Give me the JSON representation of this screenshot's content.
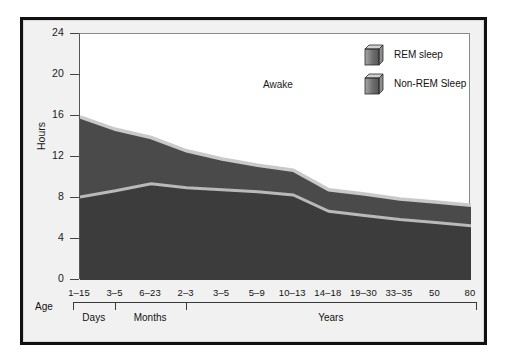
{
  "figure": {
    "axis_title_y": "Hours",
    "axis_title_x": "Age",
    "annotation_awake": "Awake"
  },
  "legend": {
    "items": [
      {
        "label": "REM sleep",
        "icon": "cube-icon",
        "color": "#6f6f6f"
      },
      {
        "label": "Non-REM Sleep",
        "icon": "cube-icon",
        "color": "#6f6f6f"
      }
    ]
  },
  "groups": [
    {
      "label": "Days",
      "start_index": 0,
      "end_index": 1
    },
    {
      "label": "Months",
      "start_index": 1,
      "end_index": 3
    },
    {
      "label": "Years",
      "start_index": 3,
      "end_index": 11
    }
  ],
  "colors": {
    "non_rem_fill": "#3c3c3c",
    "rem_fill": "#4a4a4a",
    "divider": "#b9b9b9",
    "total_edge": "#c9c9c9",
    "awake_fill": "#ffffff",
    "frame": "#111111",
    "page_bg": "#f1f1f1"
  },
  "chart_data": {
    "type": "area",
    "title": "",
    "subtitle": "",
    "xlabel": "Age",
    "ylabel": "Hours",
    "ylim": [
      0,
      24
    ],
    "yticks": [
      0,
      4,
      8,
      12,
      16,
      20,
      24
    ],
    "grid": false,
    "legend_position": "top-right",
    "stacked": true,
    "categories": [
      "1–15",
      "3–5",
      "6–23",
      "2–3",
      "3–5",
      "5–9",
      "10–13",
      "14–18",
      "19–30",
      "33–35",
      "50",
      "80"
    ],
    "category_units": [
      "Days",
      "Months",
      "Months",
      "Years",
      "Years",
      "Years",
      "Years",
      "Years",
      "Years",
      "Years",
      "Years",
      "Years"
    ],
    "series": [
      {
        "name": "Non-REM Sleep",
        "values": [
          8.1,
          8.7,
          9.4,
          9.0,
          8.8,
          8.6,
          8.3,
          6.7,
          6.3,
          5.9,
          5.6,
          5.3
        ]
      },
      {
        "name": "REM sleep",
        "values": [
          7.8,
          6.0,
          4.5,
          3.6,
          3.0,
          2.6,
          2.4,
          2.1,
          2.1,
          2.0,
          2.0,
          2.0
        ]
      },
      {
        "name": "Awake",
        "values": [
          8.1,
          9.3,
          10.1,
          11.4,
          12.2,
          12.8,
          13.3,
          15.2,
          15.6,
          16.1,
          16.4,
          16.7
        ]
      }
    ],
    "total_sleep": [
      15.9,
      14.7,
      13.9,
      12.6,
      11.8,
      11.2,
      10.7,
      8.8,
      8.4,
      7.9,
      7.6,
      7.3
    ],
    "annotations": [
      {
        "text": "Awake",
        "x_index": 6,
        "y": 20
      }
    ]
  }
}
